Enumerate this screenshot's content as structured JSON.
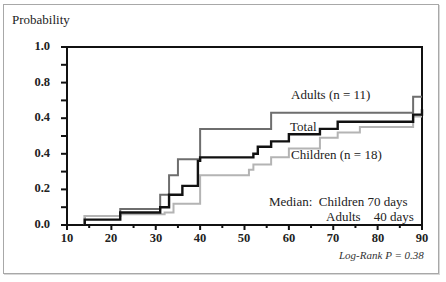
{
  "chart_data": {
    "type": "line",
    "subtype": "step (Kaplan-Meier cumulative probability)",
    "title": "",
    "xlabel": "",
    "ylabel": "Probability",
    "xlim": [
      10,
      90
    ],
    "ylim": [
      0.0,
      1.0
    ],
    "x_ticks": [
      "10",
      "20",
      "30",
      "40",
      "50",
      "60",
      "70",
      "80",
      "90"
    ],
    "y_tick_labels": [
      "1.0",
      "0.8",
      "0.4",
      "0.4",
      "0.2",
      "0.0"
    ],
    "grid": false,
    "legend_position": "inline labels",
    "series": [
      {
        "name": "Adults (n = 11)",
        "color": "#6e6e6e",
        "x": [
          14,
          22,
          31,
          33,
          35,
          40,
          56,
          88,
          90
        ],
        "y": [
          0.05,
          0.09,
          0.17,
          0.28,
          0.37,
          0.54,
          0.63,
          0.72,
          0.72
        ]
      },
      {
        "name": "Total",
        "color": "#111111",
        "x": [
          14,
          22,
          31,
          33,
          36,
          39.5,
          40,
          52,
          53,
          56,
          60,
          67,
          71,
          88,
          90
        ],
        "y": [
          0.03,
          0.07,
          0.1,
          0.17,
          0.22,
          0.36,
          0.38,
          0.4,
          0.44,
          0.47,
          0.51,
          0.54,
          0.58,
          0.62,
          0.65
        ]
      },
      {
        "name": "Children (n = 18)",
        "color": "#b4b4b4",
        "x": [
          14,
          22,
          32,
          34,
          40,
          51,
          52,
          56,
          60,
          67,
          71,
          76,
          88,
          90
        ],
        "y": [
          0.05,
          0.06,
          0.07,
          0.12,
          0.28,
          0.31,
          0.34,
          0.38,
          0.43,
          0.49,
          0.52,
          0.55,
          0.61,
          0.61
        ]
      }
    ],
    "annotations": [
      "Adults (n = 11)",
      "Total",
      "Children (n = 18)",
      "Median:  Children 70 days",
      "Adults    40 days",
      "Log-Rank P = 0.38"
    ]
  },
  "labels": {
    "ylabel": "Probability",
    "y_ticks": [
      "1.0",
      "0.8",
      "0.4",
      "0.4",
      "0.2",
      "0.0"
    ],
    "x_ticks": [
      "10",
      "20",
      "30",
      "40",
      "50",
      "60",
      "70",
      "80",
      "90"
    ],
    "adults": "Adults (n = 11)",
    "total": "Total",
    "children": "Children (n = 18)",
    "median_line1": "Median:  Children 70 days",
    "median_line2": "Adults    40 days",
    "logrank": "Log-Rank P = 0.38"
  }
}
